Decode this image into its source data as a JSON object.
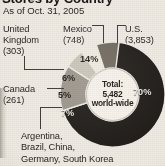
{
  "header": {
    "title": "Stores by Country",
    "subtitle": "As of Oct. 31, 2005"
  },
  "center": {
    "line1": "Total:",
    "line2": "5,482",
    "line3": "world-wide"
  },
  "labels": {
    "us": "U.S.\n(3,853)",
    "mexico": "Mexico\n(748)",
    "uk": "United\nKingdom\n(303)",
    "canada": "Canada\n(261)",
    "other": "Argentina,\nBrazil, China,\nGermany, South Korea"
  },
  "slice_labels": {
    "us": "70%",
    "mexico": "14%",
    "uk": "6%",
    "canada": "5%",
    "other": "7%"
  },
  "chart_data": {
    "type": "pie",
    "title": "Stores by Country",
    "subtitle": "As of Oct. 31, 2005",
    "total": 5482,
    "total_label": "5,482 world-wide",
    "donut": true,
    "start_angle_deg": 0,
    "direction": "clockwise",
    "legend": "callout-labels",
    "grid": false,
    "categories": [
      "U.S.",
      "Mexico",
      "United Kingdom",
      "Canada",
      "Argentina, Brazil, China, Germany, South Korea"
    ],
    "values": [
      3853,
      748,
      303,
      261,
      317
    ],
    "percentages": [
      70,
      14,
      6,
      5,
      7
    ],
    "data_labels": [
      "70%",
      "14%",
      "6%",
      "5%",
      "7%"
    ],
    "colors": [
      "#1d1a16",
      "#9b948a",
      "#c9c3b8",
      "#efeae1",
      "#6e675d"
    ],
    "slices": [
      {
        "name": "U.S.",
        "value": 3853,
        "value_label": "(3,853)",
        "percent": 70,
        "color": "#1d1a16"
      },
      {
        "name": "Mexico",
        "value": 748,
        "value_label": "(748)",
        "percent": 14,
        "color": "#9b948a"
      },
      {
        "name": "United Kingdom",
        "value": 303,
        "value_label": "(303)",
        "percent": 6,
        "color": "#c9c3b8"
      },
      {
        "name": "Canada",
        "value": 261,
        "value_label": "(261)",
        "percent": 5,
        "color": "#efeae1"
      },
      {
        "name": "Argentina, Brazil, China, Germany, South Korea",
        "value": 317,
        "value_label": "",
        "percent": 7,
        "color": "#6e675d"
      }
    ]
  }
}
